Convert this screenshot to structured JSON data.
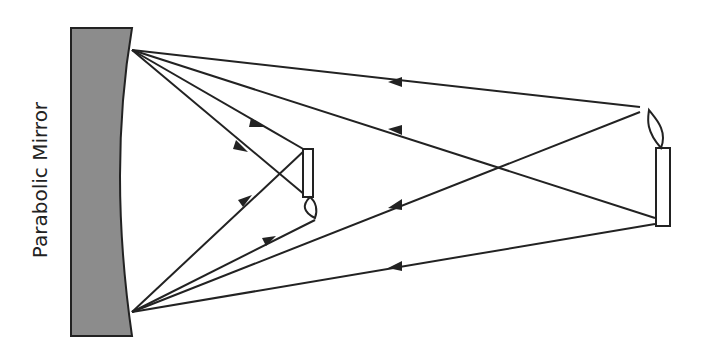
{
  "diagram": {
    "mirror_label": "Parabolic Mirror",
    "colors": {
      "mirror_fill": "#8c8c8c",
      "line": "#222222",
      "background": "#ffffff"
    },
    "elements": [
      "parabolic mirror",
      "object candle (right, upright)",
      "real image candle (inverted, near focal region)",
      "incident rays with arrows toward mirror",
      "reflected rays converging to image"
    ]
  }
}
